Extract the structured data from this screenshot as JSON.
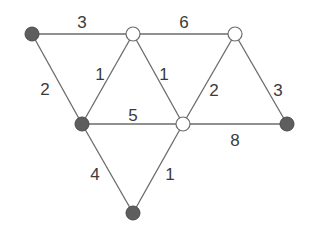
{
  "graph": {
    "nodes": [
      {
        "id": "A",
        "x": 32,
        "y": 34,
        "filled": true
      },
      {
        "id": "B",
        "x": 133,
        "y": 34,
        "filled": false
      },
      {
        "id": "C",
        "x": 235,
        "y": 34,
        "filled": false
      },
      {
        "id": "D",
        "x": 82,
        "y": 124,
        "filled": true
      },
      {
        "id": "E",
        "x": 183,
        "y": 124,
        "filled": false
      },
      {
        "id": "F",
        "x": 287,
        "y": 124,
        "filled": true
      },
      {
        "id": "G",
        "x": 133,
        "y": 213,
        "filled": true
      }
    ],
    "edges": [
      {
        "from": "A",
        "to": "B",
        "weight": "3",
        "lx": 82,
        "ly": 24
      },
      {
        "from": "B",
        "to": "C",
        "weight": "6",
        "lx": 184,
        "ly": 24
      },
      {
        "from": "A",
        "to": "D",
        "weight": "2",
        "lx": 45,
        "ly": 91
      },
      {
        "from": "D",
        "to": "B",
        "weight": "1",
        "lx": 100,
        "ly": 76
      },
      {
        "from": "B",
        "to": "E",
        "weight": "1",
        "lx": 164,
        "ly": 76
      },
      {
        "from": "E",
        "to": "C",
        "weight": "2",
        "lx": 214,
        "ly": 92
      },
      {
        "from": "C",
        "to": "F",
        "weight": "3",
        "lx": 278,
        "ly": 92
      },
      {
        "from": "D",
        "to": "E",
        "weight": "5",
        "lx": 133,
        "ly": 117
      },
      {
        "from": "E",
        "to": "F",
        "weight": "8",
        "lx": 235,
        "ly": 142
      },
      {
        "from": "D",
        "to": "G",
        "weight": "4",
        "lx": 95,
        "ly": 176
      },
      {
        "from": "G",
        "to": "E",
        "weight": "1",
        "lx": 170,
        "ly": 176
      }
    ]
  }
}
